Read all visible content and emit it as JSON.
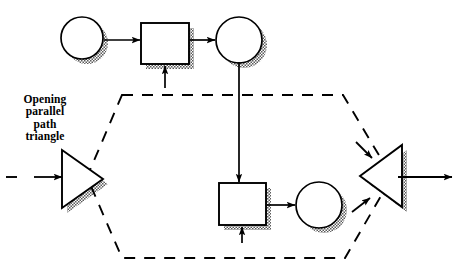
{
  "diagram": {
    "title": "Opening parallel path triangle",
    "caption": {
      "text": "Opening\nparallel\npath\ntriangle",
      "lines": [
        "Opening",
        "parallel",
        "path",
        "triangle"
      ]
    },
    "colors": {
      "stroke": "#000000",
      "fill": "#ffffff",
      "shadow": "#808080",
      "background": "#ffffff"
    },
    "style": {
      "stroke_width": 1.6,
      "dash_pattern": "10,8",
      "shadow_offset_x": 5,
      "shadow_offset_y": 5
    },
    "nodes": [
      {
        "id": "circle-top-left",
        "shape": "circle",
        "cx": 82,
        "cy": 38,
        "r": 21,
        "label": ""
      },
      {
        "id": "rect-top",
        "shape": "rectangle",
        "x": 141,
        "y": 23,
        "w": 48,
        "h": 41,
        "label": ""
      },
      {
        "id": "circle-top-right",
        "shape": "circle",
        "cx": 239,
        "cy": 40,
        "r": 23,
        "label": ""
      },
      {
        "id": "rect-bottom",
        "shape": "rectangle",
        "x": 219,
        "y": 183,
        "w": 47,
        "h": 42,
        "label": ""
      },
      {
        "id": "circle-bottom-right",
        "shape": "circle",
        "cx": 319,
        "cy": 205,
        "r": 23,
        "label": ""
      },
      {
        "id": "triangle-opening",
        "shape": "triangle-right",
        "x": 62,
        "y": 150,
        "w": 41,
        "h": 58,
        "label": "Opening parallel path triangle"
      },
      {
        "id": "triangle-closing",
        "shape": "triangle-left",
        "x": 360,
        "y": 145,
        "w": 42,
        "h": 62,
        "label": ""
      }
    ],
    "connectors": [
      {
        "id": "arrow-circle-to-rect-top",
        "from": "circle-top-left",
        "to": "rect-top",
        "type": "solid-arrow",
        "direction": "right"
      },
      {
        "id": "arrow-rect-to-circle-top",
        "from": "rect-top",
        "to": "circle-top-right",
        "type": "solid-arrow",
        "direction": "right"
      },
      {
        "id": "arrow-into-rect-top-bottom",
        "from": "parallel-path-boundary",
        "to": "rect-top",
        "type": "solid-arrow",
        "direction": "up"
      },
      {
        "id": "arrow-circle-top-to-rect-bottom",
        "from": "circle-top-right",
        "to": "rect-bottom",
        "type": "solid-arrow",
        "direction": "down"
      },
      {
        "id": "arrow-into-rect-bottom",
        "from": "parallel-path-boundary",
        "to": "rect-bottom",
        "type": "solid-arrow",
        "direction": "up"
      },
      {
        "id": "arrow-rect-to-circle-bottom",
        "from": "rect-bottom",
        "to": "circle-bottom-right",
        "type": "solid-arrow",
        "direction": "right"
      },
      {
        "id": "arrow-input-to-opening-triangle",
        "type": "dashed-then-arrow",
        "direction": "right",
        "x1": 8,
        "x2": 62,
        "y": 177
      },
      {
        "id": "arrow-output-from-closing-triangle",
        "type": "solid-arrow",
        "direction": "right",
        "x1": 412,
        "x2": 452,
        "y": 177
      },
      {
        "id": "arrow-upper-into-closing-triangle",
        "type": "solid-arrow",
        "direction": "down-right"
      },
      {
        "id": "arrow-lower-into-closing-triangle",
        "type": "solid-arrow",
        "direction": "up-right"
      }
    ],
    "parallel_path_boundary": {
      "id": "dashed-hexagon",
      "type": "dashed-hexagon",
      "points": "122,95 343,95 392,177 345,258 122,258 87,177"
    }
  }
}
